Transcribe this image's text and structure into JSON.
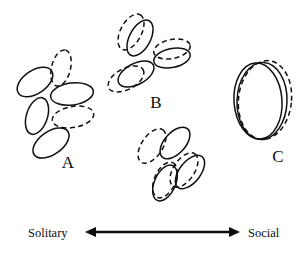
{
  "figure": {
    "width": 302,
    "height": 254,
    "background": "#ffffff",
    "ink_color": "#101010",
    "title_text": ""
  },
  "axis": {
    "left_label": "Solitary",
    "right_label": "Social",
    "left_label_x": 28,
    "right_label_x": 248,
    "label_y": 237,
    "line_y": 232,
    "line_x_start": 85,
    "line_x_end": 240,
    "arrowheads": "both",
    "color": "#0d0d0d"
  },
  "clusters": [
    {
      "id": "A",
      "label": "A",
      "label_x": 68,
      "label_y": 168,
      "overlap_state": "none",
      "ellipse_count": 6,
      "solid_count": 4,
      "dashed_count": 2,
      "ellipses": [
        {
          "cx": 35,
          "cy": 82,
          "rx": 20.0,
          "ry": 11.5,
          "rot": -34,
          "style": "solid"
        },
        {
          "cx": 61,
          "cy": 68,
          "rx": 18.5,
          "ry": 9.5,
          "rot": -76,
          "style": "dashed"
        },
        {
          "cx": 72,
          "cy": 94,
          "rx": 21.5,
          "ry": 11.0,
          "rot": -8,
          "style": "solid"
        },
        {
          "cx": 37,
          "cy": 116,
          "rx": 19.0,
          "ry": 10.5,
          "rot": -72,
          "style": "solid"
        },
        {
          "cx": 73,
          "cy": 117,
          "rx": 21.0,
          "ry": 10.5,
          "rot": -10,
          "style": "dashed"
        },
        {
          "cx": 51,
          "cy": 143,
          "rx": 20.5,
          "ry": 11.5,
          "rot": -35,
          "style": "solid"
        }
      ]
    },
    {
      "id": "B",
      "label": "B",
      "label_x": 156,
      "label_y": 108,
      "overlap_state": "partial",
      "ellipse_count": 12,
      "solid_count": 6,
      "dashed_count": 6,
      "ellipses": [
        {
          "cx": 131,
          "cy": 32,
          "rx": 19.5,
          "ry": 10.5,
          "rot": -62,
          "style": "dashed"
        },
        {
          "cx": 140,
          "cy": 38,
          "rx": 19.5,
          "ry": 10.5,
          "rot": -62,
          "style": "solid"
        },
        {
          "cx": 172,
          "cy": 49,
          "rx": 18.5,
          "ry": 9.5,
          "rot": -12,
          "style": "dashed"
        },
        {
          "cx": 172,
          "cy": 58,
          "rx": 18.5,
          "ry": 9.5,
          "rot": -12,
          "style": "solid"
        },
        {
          "cx": 126,
          "cy": 79,
          "rx": 19.5,
          "ry": 10.5,
          "rot": -28,
          "style": "dashed"
        },
        {
          "cx": 136,
          "cy": 74,
          "rx": 19.5,
          "ry": 10.5,
          "rot": -28,
          "style": "solid"
        },
        {
          "cx": 152,
          "cy": 146,
          "rx": 19.5,
          "ry": 10.5,
          "rot": -56,
          "style": "dashed"
        },
        {
          "cx": 175,
          "cy": 143,
          "rx": 19.0,
          "ry": 10.5,
          "rot": -48,
          "style": "solid"
        },
        {
          "cx": 184,
          "cy": 170,
          "rx": 19.5,
          "ry": 10.5,
          "rot": -56,
          "style": "dashed"
        },
        {
          "cx": 190,
          "cy": 172,
          "rx": 19.5,
          "ry": 10.5,
          "rot": -52,
          "style": "solid"
        },
        {
          "cx": 165,
          "cy": 180,
          "rx": 19.0,
          "ry": 10.5,
          "rot": -66,
          "style": "dashed"
        },
        {
          "cx": 165,
          "cy": 183,
          "rx": 19.0,
          "ry": 10.5,
          "rot": -66,
          "style": "solid"
        }
      ]
    },
    {
      "id": "C",
      "label": "C",
      "label_x": 278,
      "label_y": 162,
      "overlap_state": "near-coincident",
      "ellipse_count": 3,
      "solid_count": 2,
      "dashed_count": 1,
      "ellipses": [
        {
          "cx": 258,
          "cy": 101,
          "rx": 24.0,
          "ry": 38.0,
          "rot": -4,
          "style": "solid"
        },
        {
          "cx": 262,
          "cy": 101,
          "rx": 25.0,
          "ry": 38.5,
          "rot": 2,
          "style": "solid"
        },
        {
          "cx": 265,
          "cy": 100,
          "rx": 26.5,
          "ry": 39.5,
          "rot": 6,
          "style": "dashed"
        }
      ]
    }
  ],
  "legend": {
    "solid_meaning": "solid ellipse",
    "dashed_meaning": "dashed ellipse"
  }
}
